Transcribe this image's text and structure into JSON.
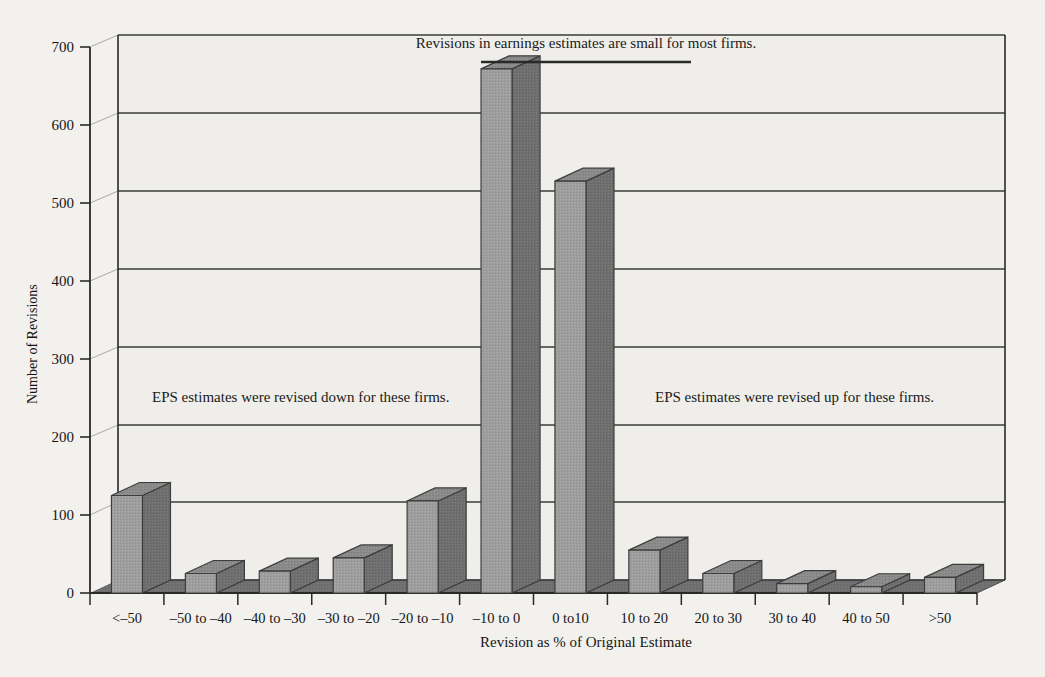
{
  "chart_data": {
    "type": "bar",
    "title": "",
    "xlabel": "Revision as % of Original Estimate",
    "ylabel": "Number of Revisions",
    "ylim": [
      0,
      700
    ],
    "ytick_values": [
      0,
      100,
      200,
      300,
      400,
      500,
      600,
      700
    ],
    "ytick_labels": [
      "0",
      "100",
      "200",
      "300",
      "400",
      "500",
      "600",
      "700"
    ],
    "grid": true,
    "grid_axis": "y",
    "legend": "none",
    "style": "3d-histogram",
    "categories": [
      "<–50",
      "–50 to –40",
      "–40 to –30",
      "–30 to –20",
      "–20 to –10",
      "–10 to 0",
      "0 to10",
      "10 to 20",
      "20 to 30",
      "30 to 40",
      "40 to 50",
      ">50"
    ],
    "values": [
      125,
      25,
      28,
      45,
      118,
      672,
      528,
      55,
      25,
      12,
      8,
      20
    ],
    "annotations": [
      {
        "name": "top-annotation",
        "text": "Revisions in earnings estimates are small for most firms.",
        "has_underline": true
      },
      {
        "name": "left-annotation",
        "text": "EPS estimates were revised down for these firms.",
        "has_underline": false
      },
      {
        "name": "right-annotation",
        "text": "EPS estimates were revised up for these firms.",
        "has_underline": false
      }
    ],
    "colors": {
      "background": "#f2f1ee",
      "bar_front": "#9e9e9e",
      "bar_side": "#6e6e6e",
      "bar_top": "#8c8c8c",
      "floor": "#6f6f6f",
      "wall": "#efeeea",
      "axis_line": "#2a2a2a",
      "gridline": "#3a3a3a",
      "text": "#161616"
    }
  }
}
